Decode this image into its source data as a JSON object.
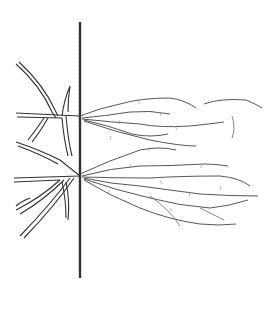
{
  "illustration": {
    "subject": "botanical line drawing of a rooted stem with branching shoots and fine roots",
    "ink_color": "#333333",
    "fine_ink_color": "#777777",
    "background": "#ffffff"
  }
}
